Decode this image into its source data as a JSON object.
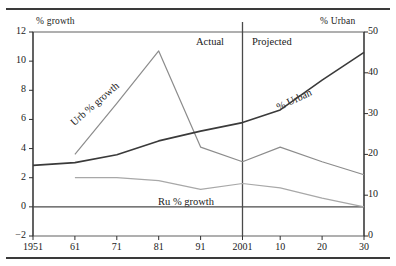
{
  "figure": {
    "left_axis_title": "% growth",
    "right_axis_title": "% Urban",
    "zone_actual": "Actual",
    "zone_projected": "Projected",
    "divider_year": "2001"
  },
  "labels": {
    "urb_growth": "Urb % growth",
    "ru_growth": "Ru % growth",
    "urban": "% Urban"
  },
  "ticks": {
    "left": [
      "12",
      "10",
      "8",
      "6",
      "4",
      "2",
      "0",
      "−2"
    ],
    "right": [
      "50",
      "40",
      "30",
      "20",
      "10",
      "0"
    ],
    "x": [
      "1951",
      "61",
      "71",
      "81",
      "91",
      "2001",
      "10",
      "20",
      "30"
    ]
  },
  "colors": {
    "urb_growth": "#8c8c8c",
    "ru_growth": "#a8a8a8",
    "urban": "#3a3a3a",
    "axis": "#6e6e6e",
    "rule": "#3a3a3a"
  },
  "chart_data": {
    "type": "line",
    "title": "",
    "xlabel": "",
    "ylabel": "% growth",
    "y2label": "% Urban",
    "x": [
      1951,
      1961,
      1971,
      1981,
      1991,
      2001,
      2010,
      2020,
      2030
    ],
    "xtick_labels": [
      "1951",
      "61",
      "71",
      "81",
      "91",
      "2001",
      "10",
      "20",
      "30"
    ],
    "ylim": [
      -2,
      12
    ],
    "y2lim": [
      0,
      50
    ],
    "yticks": [
      -2,
      0,
      2,
      4,
      6,
      8,
      10,
      12
    ],
    "y2ticks": [
      0,
      10,
      20,
      30,
      40,
      50
    ],
    "grid": false,
    "legend": "inline-annotations",
    "annotations": [
      {
        "text": "Actual",
        "x": 1988
      },
      {
        "text": "Projected",
        "x": 2006
      },
      {
        "text": "Urb % growth",
        "series": "Urb % growth"
      },
      {
        "text": "Ru % growth",
        "series": "Ru % growth"
      },
      {
        "text": "% Urban",
        "series": "% Urban"
      }
    ],
    "vline": {
      "x": 2001,
      "label": "Actual / Projected divider"
    },
    "hline": {
      "y": 0
    },
    "series": [
      {
        "name": "Urb % growth",
        "axis": "left",
        "units": "% growth",
        "x": [
          1961,
          1971,
          1981,
          1991,
          2001,
          2010,
          2020,
          2030
        ],
        "values": [
          3.6,
          7.1,
          10.7,
          4.1,
          3.1,
          4.1,
          3.1,
          2.2
        ]
      },
      {
        "name": "Ru % growth",
        "axis": "left",
        "units": "% growth",
        "x": [
          1961,
          1971,
          1981,
          1991,
          2001,
          2010,
          2020,
          2030
        ],
        "values": [
          2.0,
          2.0,
          1.8,
          1.2,
          1.6,
          1.3,
          0.6,
          0.0
        ]
      },
      {
        "name": "% Urban",
        "axis": "right",
        "units": "% urban",
        "x": [
          1951,
          1961,
          1971,
          1981,
          1991,
          2001,
          2010,
          2020,
          2030
        ],
        "values": [
          17.3,
          18.0,
          19.9,
          23.3,
          25.7,
          27.8,
          30.9,
          38.2,
          45.0
        ]
      }
    ]
  }
}
